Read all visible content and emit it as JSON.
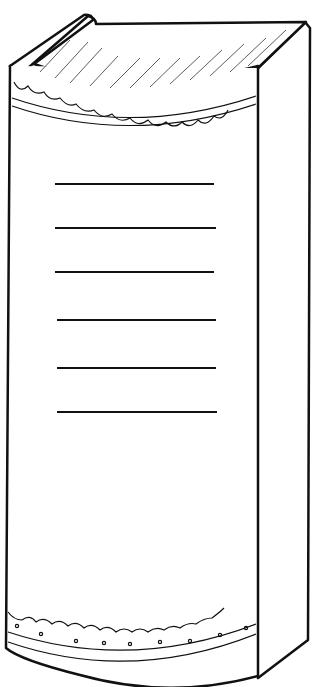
{
  "illustration": {
    "subject": "book spine line drawing",
    "stroke_color": "#111111",
    "fill_color": "#ffffff",
    "title_lines_count": 6
  }
}
